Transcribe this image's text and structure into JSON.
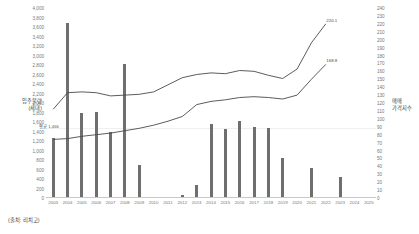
{
  "source_note": "(출처: 리치고)",
  "axes": {
    "left_title_line1": "입주물량",
    "left_title_line2": "(세대)",
    "right_title_line1": "매매",
    "right_title_line2": "가격지수"
  },
  "annotations": {
    "average_label": "평균 1,466",
    "average_value": 1466,
    "series1_end_label": "220.1",
    "series2_end_label": "168.8"
  },
  "chart_data": {
    "type": "bar",
    "title": "",
    "subtitle": "",
    "xlabel": "",
    "ylabel": "입주물량 (세대)",
    "y2label": "매매 가격지수",
    "grid": true,
    "legend_position": "none",
    "ylim": [
      0,
      4000
    ],
    "y2lim": [
      0,
      240
    ],
    "ytick_step": 200,
    "y2tick_step": 10,
    "categories": [
      "2003",
      "2004",
      "2005",
      "2006",
      "2007",
      "2008",
      "2009",
      "2010",
      "2011",
      "2012",
      "2013",
      "2014",
      "2015",
      "2016",
      "2017",
      "2018",
      "2019",
      "2020",
      "2021",
      "2022",
      "2023",
      "2024",
      "2025"
    ],
    "yticks": [
      "4,000",
      "3,800",
      "3,600",
      "3,400",
      "3,200",
      "3,000",
      "2,800",
      "2,600",
      "2,400",
      "2,200",
      "2,000",
      "1,800",
      "1,600",
      "1,400",
      "1,200",
      "1,000",
      "800",
      "600",
      "400",
      "200",
      "0"
    ],
    "y2ticks": [
      "240",
      "230",
      "220",
      "210",
      "200",
      "190",
      "180",
      "170",
      "160",
      "150",
      "140",
      "130",
      "120",
      "110",
      "100",
      "90",
      "80",
      "70",
      "60",
      "50",
      "40",
      "30",
      "20",
      "10",
      "0"
    ],
    "series": [
      {
        "name": "입주물량",
        "type": "bar",
        "axis": "left",
        "color": "#6f6f6f",
        "values": [
          1260,
          3680,
          1780,
          1820,
          1380,
          2820,
          700,
          0,
          0,
          60,
          270,
          1560,
          1460,
          1620,
          1500,
          1480,
          850,
          0,
          640,
          0,
          440,
          0,
          0
        ]
      },
      {
        "name": "매매 가격지수 (상위)",
        "type": "line",
        "axis": "right",
        "color": "#4a4a4a",
        "values": [
          112,
          133,
          134,
          133,
          129,
          130,
          131,
          134,
          143,
          152,
          156,
          158,
          157,
          161,
          160,
          155,
          151,
          163,
          196,
          220.1,
          null,
          null,
          null
        ]
      },
      {
        "name": "매매 가격지수 (하위)",
        "type": "line",
        "axis": "right",
        "color": "#4a4a4a",
        "values": [
          74,
          75,
          78,
          80,
          82,
          85,
          88,
          92,
          97,
          103,
          118,
          122,
          124,
          127,
          128,
          127,
          125,
          130,
          150,
          168.8,
          null,
          null,
          null
        ]
      }
    ]
  }
}
